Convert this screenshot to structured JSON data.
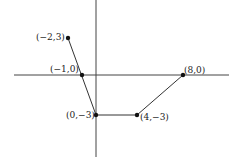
{
  "diagram": {
    "type": "piecewise-linear-graph",
    "axes": {
      "x_axis": true,
      "y_axis": true
    },
    "points": [
      {
        "label": "(−2,3)",
        "x": -2,
        "y": 3
      },
      {
        "label": "(−1,0)",
        "x": -1,
        "y": 0
      },
      {
        "label": "(0,−3)",
        "x": 0,
        "y": -3
      },
      {
        "label": "(4,−3)",
        "x": 4,
        "y": -3
      },
      {
        "label": "(8,0)",
        "x": 8,
        "y": 0
      }
    ],
    "segments": [
      [
        "(-2,3)",
        "(0,-3)"
      ],
      [
        "(0,-3)",
        "(4,-3)"
      ],
      [
        "(4,-3)",
        "(8,0)"
      ]
    ],
    "colors": {
      "line": "#333333",
      "point": "#111111",
      "axis": "#444444"
    }
  }
}
